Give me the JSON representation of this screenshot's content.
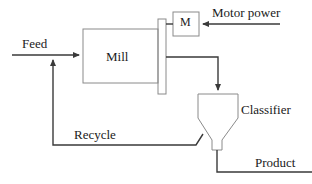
{
  "diagram": {
    "colors": {
      "background": "#ffffff",
      "flow_line": "#3a3a3a",
      "equipment_outline": "#8a8a8a",
      "text": "#1a1a1a"
    },
    "equipment": [
      {
        "id": "mill",
        "label": "Mill",
        "shape": "rectangle"
      },
      {
        "id": "motor",
        "label": "M",
        "shape": "square"
      },
      {
        "id": "classifier",
        "label": "Classifier",
        "shape": "funnel"
      },
      {
        "id": "flange",
        "label": "",
        "shape": "tall-rectangle"
      }
    ],
    "streams": [
      {
        "id": "feed",
        "label": "Feed",
        "direction": "right"
      },
      {
        "id": "motor-power",
        "label": "Motor power",
        "direction": "left"
      },
      {
        "id": "mill-outlet",
        "label": "",
        "direction": "down"
      },
      {
        "id": "recycle",
        "label": "Recycle",
        "direction": "up"
      },
      {
        "id": "product",
        "label": "Product",
        "direction": "right"
      }
    ],
    "labels": {
      "feed": "Feed",
      "mill": "Mill",
      "motor": "M",
      "motor_power": "Motor power",
      "classifier": "Classifier",
      "recycle": "Recycle",
      "product": "Product"
    }
  }
}
